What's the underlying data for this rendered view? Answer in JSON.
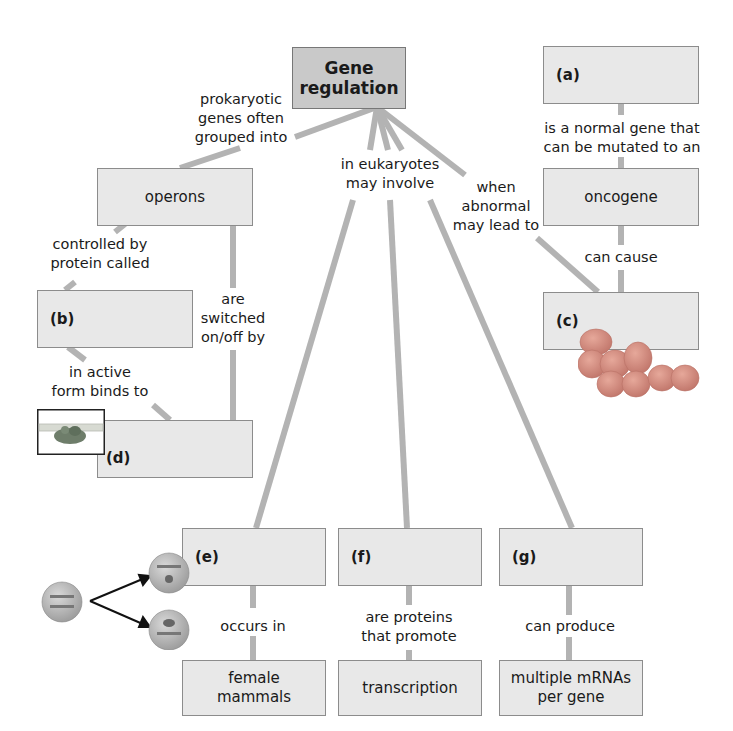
{
  "root": {
    "label": "Gene\nregulation",
    "line1": "Gene",
    "line2": "regulation"
  },
  "nodes": {
    "a": {
      "letter": "(a)"
    },
    "oncogene": {
      "label": "oncogene"
    },
    "c": {
      "letter": "(c)"
    },
    "operons": {
      "label": "operons"
    },
    "b": {
      "letter": "(b)"
    },
    "d": {
      "letter": "(d)"
    },
    "e": {
      "letter": "(e)"
    },
    "f": {
      "letter": "(f)"
    },
    "g": {
      "letter": "(g)"
    },
    "female_mammals": {
      "line1": "female",
      "line2": "mammals"
    },
    "transcription": {
      "label": "transcription"
    },
    "multiple_mrnas": {
      "line1": "multiple mRNAs",
      "line2": "per gene"
    }
  },
  "links": {
    "prokaryotic": {
      "line1": "prokaryotic",
      "line2": "genes often",
      "line3": "grouped into"
    },
    "eukaryotes": {
      "line1": "in eukaryotes",
      "line2": "may involve"
    },
    "abnormal": {
      "line1": "when",
      "line2": "abnormal",
      "line3": "may lead to"
    },
    "normal_gene": {
      "line1": "is a normal gene that",
      "line2": "can be mutated to an"
    },
    "can_cause": {
      "label": "can cause"
    },
    "controlled_by": {
      "line1": "controlled by",
      "line2": "protein called"
    },
    "switched": {
      "line1": "are",
      "line2": "switched",
      "line3": "on/off by"
    },
    "active_form": {
      "line1": "in active",
      "line2": "form binds to"
    },
    "occurs_in": {
      "label": "occurs in"
    },
    "proteins_promote": {
      "line1": "are proteins",
      "line2": "that promote"
    },
    "can_produce": {
      "label": "can produce"
    }
  },
  "colors": {
    "box_fill": "#e8e8e8",
    "root_fill": "#c9c9c9",
    "border": "#8c8c8c",
    "connector": "#b3b3b3",
    "cell": "#b0b0b0",
    "tumor": "#d98f7f",
    "arrow": "#111111"
  }
}
